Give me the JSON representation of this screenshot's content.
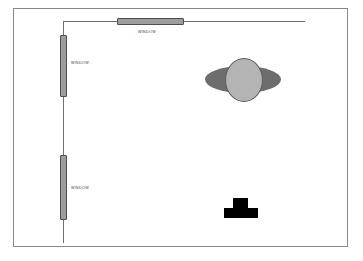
{
  "diagram": {
    "background_color": "#ffffff",
    "border_color": "#8a8a8a",
    "wall_color": "#6f6f6f"
  },
  "windows": [
    {
      "id": "top",
      "label": "WINDOW",
      "orientation": "horizontal",
      "fill_color": "#9d9d9d",
      "stroke_color": "#4e4e4e"
    },
    {
      "id": "upper-left",
      "label": "WINDOW",
      "orientation": "vertical",
      "fill_color": "#9d9d9d",
      "stroke_color": "#4e4e4e"
    },
    {
      "id": "lower-left",
      "label": "WINDOW",
      "orientation": "vertical",
      "fill_color": "#9d9d9d",
      "stroke_color": "#4e4e4e"
    }
  ],
  "shapes": {
    "planet": {
      "name": "planet",
      "ring_color": "#6d6d6d",
      "body_color": "#b4b4b4",
      "body_stroke_color": "#5f5f5f"
    },
    "block_object": {
      "name": "t-shaped-object",
      "fill_color": "#000000"
    }
  }
}
